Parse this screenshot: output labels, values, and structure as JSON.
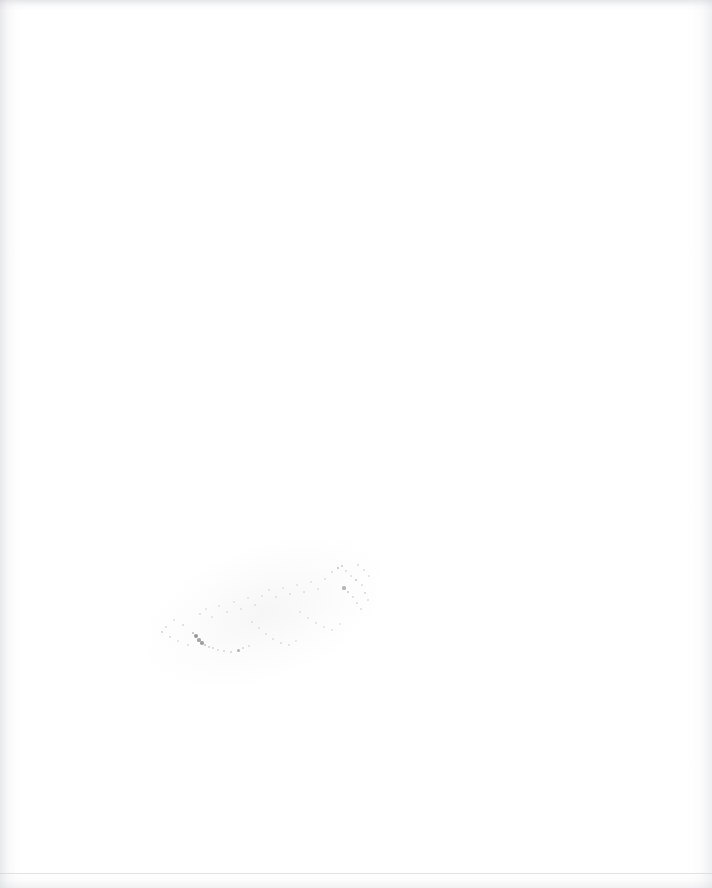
{
  "document": {
    "page_label": "",
    "page_type": "blank-scanned-page",
    "visible_text": "",
    "background_color": "#ffffff"
  },
  "artifacts": {
    "smudge": {
      "name": "faint-diagonal-smudge",
      "description_label": "",
      "region": {
        "x": 158,
        "y": 562,
        "width": 214,
        "height": 100
      },
      "angle_deg": -20,
      "ink_color": "#6e7076"
    },
    "scan_edges": {
      "left_shadow_color": "#c4c7cc",
      "right_shadow_color": "#cdd0d5",
      "top_shadow_color": "#c6c9ce",
      "bottom_shadow_color": "#d6d8dc"
    }
  },
  "speck_clusters": [
    {
      "x": 162,
      "y": 632,
      "r": 1.0,
      "o": 0.3
    },
    {
      "x": 166,
      "y": 627,
      "r": 0.8,
      "o": 0.22
    },
    {
      "x": 170,
      "y": 637,
      "r": 1.1,
      "o": 0.26
    },
    {
      "x": 174,
      "y": 620,
      "r": 0.7,
      "o": 0.18
    },
    {
      "x": 178,
      "y": 641,
      "r": 0.9,
      "o": 0.2
    },
    {
      "x": 183,
      "y": 625,
      "r": 0.8,
      "o": 0.24
    },
    {
      "x": 188,
      "y": 645,
      "r": 1.0,
      "o": 0.22
    },
    {
      "x": 193,
      "y": 633,
      "r": 1.3,
      "o": 0.46
    },
    {
      "x": 196,
      "y": 636,
      "r": 2.0,
      "o": 0.72
    },
    {
      "x": 199,
      "y": 640,
      "r": 1.6,
      "o": 0.6
    },
    {
      "x": 202,
      "y": 643,
      "r": 1.8,
      "o": 0.66
    },
    {
      "x": 205,
      "y": 645,
      "r": 1.2,
      "o": 0.44
    },
    {
      "x": 209,
      "y": 647,
      "r": 0.9,
      "o": 0.3
    },
    {
      "x": 213,
      "y": 648,
      "r": 0.8,
      "o": 0.26
    },
    {
      "x": 218,
      "y": 650,
      "r": 0.7,
      "o": 0.22
    },
    {
      "x": 224,
      "y": 651,
      "r": 0.8,
      "o": 0.24
    },
    {
      "x": 231,
      "y": 652,
      "r": 1.0,
      "o": 0.28
    },
    {
      "x": 238,
      "y": 650,
      "r": 1.5,
      "o": 0.52
    },
    {
      "x": 243,
      "y": 648,
      "r": 0.9,
      "o": 0.26
    },
    {
      "x": 249,
      "y": 646,
      "r": 0.7,
      "o": 0.2
    },
    {
      "x": 200,
      "y": 614,
      "r": 0.8,
      "o": 0.2
    },
    {
      "x": 206,
      "y": 609,
      "r": 0.7,
      "o": 0.16
    },
    {
      "x": 212,
      "y": 617,
      "r": 0.9,
      "o": 0.18
    },
    {
      "x": 219,
      "y": 606,
      "r": 0.8,
      "o": 0.17
    },
    {
      "x": 227,
      "y": 612,
      "r": 1.0,
      "o": 0.19
    },
    {
      "x": 234,
      "y": 602,
      "r": 0.7,
      "o": 0.15
    },
    {
      "x": 241,
      "y": 609,
      "r": 0.9,
      "o": 0.18
    },
    {
      "x": 248,
      "y": 598,
      "r": 0.8,
      "o": 0.16
    },
    {
      "x": 255,
      "y": 605,
      "r": 1.0,
      "o": 0.2
    },
    {
      "x": 262,
      "y": 596,
      "r": 0.8,
      "o": 0.17
    },
    {
      "x": 252,
      "y": 622,
      "r": 0.9,
      "o": 0.19
    },
    {
      "x": 259,
      "y": 628,
      "r": 0.8,
      "o": 0.17
    },
    {
      "x": 266,
      "y": 634,
      "r": 1.0,
      "o": 0.21
    },
    {
      "x": 273,
      "y": 639,
      "r": 0.9,
      "o": 0.19
    },
    {
      "x": 281,
      "y": 643,
      "r": 1.1,
      "o": 0.23
    },
    {
      "x": 289,
      "y": 645,
      "r": 0.8,
      "o": 0.18
    },
    {
      "x": 296,
      "y": 641,
      "r": 0.9,
      "o": 0.17
    },
    {
      "x": 269,
      "y": 590,
      "r": 0.8,
      "o": 0.16
    },
    {
      "x": 276,
      "y": 597,
      "r": 1.0,
      "o": 0.2
    },
    {
      "x": 283,
      "y": 588,
      "r": 0.7,
      "o": 0.15
    },
    {
      "x": 290,
      "y": 594,
      "r": 0.9,
      "o": 0.18
    },
    {
      "x": 297,
      "y": 585,
      "r": 0.8,
      "o": 0.16
    },
    {
      "x": 304,
      "y": 592,
      "r": 1.0,
      "o": 0.2
    },
    {
      "x": 311,
      "y": 582,
      "r": 0.8,
      "o": 0.17
    },
    {
      "x": 318,
      "y": 589,
      "r": 0.9,
      "o": 0.19
    },
    {
      "x": 325,
      "y": 579,
      "r": 1.0,
      "o": 0.21
    },
    {
      "x": 300,
      "y": 612,
      "r": 0.9,
      "o": 0.18
    },
    {
      "x": 308,
      "y": 618,
      "r": 0.8,
      "o": 0.16
    },
    {
      "x": 316,
      "y": 623,
      "r": 1.0,
      "o": 0.19
    },
    {
      "x": 324,
      "y": 627,
      "r": 0.9,
      "o": 0.18
    },
    {
      "x": 332,
      "y": 630,
      "r": 0.8,
      "o": 0.16
    },
    {
      "x": 340,
      "y": 624,
      "r": 0.9,
      "o": 0.17
    },
    {
      "x": 332,
      "y": 572,
      "r": 1.0,
      "o": 0.22
    },
    {
      "x": 338,
      "y": 568,
      "r": 1.4,
      "o": 0.42
    },
    {
      "x": 342,
      "y": 566,
      "r": 1.1,
      "o": 0.34
    },
    {
      "x": 346,
      "y": 571,
      "r": 0.9,
      "o": 0.24
    },
    {
      "x": 351,
      "y": 576,
      "r": 0.8,
      "o": 0.2
    },
    {
      "x": 344,
      "y": 588,
      "r": 1.6,
      "o": 0.5
    },
    {
      "x": 348,
      "y": 592,
      "r": 1.2,
      "o": 0.36
    },
    {
      "x": 353,
      "y": 597,
      "r": 0.9,
      "o": 0.24
    },
    {
      "x": 357,
      "y": 603,
      "r": 1.0,
      "o": 0.26
    },
    {
      "x": 361,
      "y": 609,
      "r": 0.9,
      "o": 0.22
    },
    {
      "x": 356,
      "y": 580,
      "r": 1.3,
      "o": 0.38
    },
    {
      "x": 362,
      "y": 585,
      "r": 0.9,
      "o": 0.22
    },
    {
      "x": 365,
      "y": 593,
      "r": 1.1,
      "o": 0.28
    },
    {
      "x": 368,
      "y": 600,
      "r": 0.8,
      "o": 0.2
    },
    {
      "x": 358,
      "y": 565,
      "r": 0.9,
      "o": 0.24
    },
    {
      "x": 364,
      "y": 570,
      "r": 0.8,
      "o": 0.2
    },
    {
      "x": 369,
      "y": 576,
      "r": 0.7,
      "o": 0.18
    }
  ]
}
